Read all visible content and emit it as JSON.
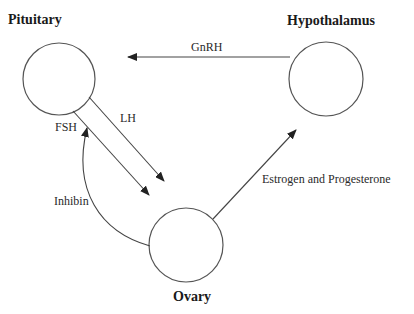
{
  "diagram": {
    "type": "hormone-feedback-flow",
    "nodes": [
      {
        "id": "pituitary",
        "label": "Pituitary",
        "cx": 59,
        "cy": 79,
        "r": 36,
        "label_x": 8,
        "label_y": 24
      },
      {
        "id": "hypothalamus",
        "label": "Hypothalamus",
        "cx": 326,
        "cy": 79,
        "r": 37,
        "label_x": 287,
        "label_y": 25
      },
      {
        "id": "ovary",
        "label": "Ovary",
        "cx": 186,
        "cy": 245,
        "r": 37,
        "label_x": 173,
        "label_y": 301
      }
    ],
    "edges": [
      {
        "id": "gnrh",
        "from": "hypothalamus",
        "to": "pituitary",
        "label": "GnRH",
        "label_x": 191,
        "label_y": 51
      },
      {
        "id": "lh",
        "from": "pituitary",
        "to": "ovary",
        "label": "LH",
        "label_x": 120,
        "label_y": 122
      },
      {
        "id": "fsh",
        "from": "pituitary",
        "to": "ovary",
        "label": "FSH",
        "label_x": 55,
        "label_y": 131
      },
      {
        "id": "inhibin",
        "from": "ovary",
        "to": "pituitary",
        "label": "Inhibin",
        "label_x": 54,
        "label_y": 205
      },
      {
        "id": "estrogen_progesterone",
        "from": "ovary",
        "to": "hypothalamus",
        "label": "Estrogen and Progesterone",
        "label_x": 262,
        "label_y": 183
      }
    ]
  },
  "colors": {
    "stroke": "#444444",
    "node_stroke": "#555555",
    "text": "#1a1a1a",
    "background": "#ffffff"
  }
}
